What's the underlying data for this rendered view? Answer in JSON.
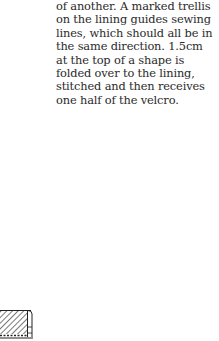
{
  "document": {
    "paragraph_lines": [
      "of another. A marked trellis",
      "on the lining guides sewing",
      "lines, which should all be in",
      "the same direction. 1.5cm",
      "at the top of a shape is",
      "folded over to the lining,",
      "stitched and then receives",
      "one half of the velcro."
    ]
  },
  "illustration": {
    "icon": "hatched-fabric-cross-section",
    "stroke_color": "#222222"
  }
}
